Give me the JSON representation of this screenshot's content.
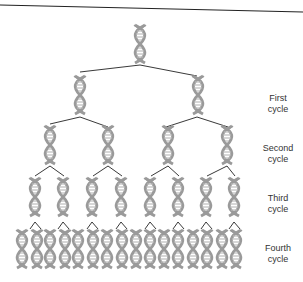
{
  "diagram": {
    "type": "replication-tree",
    "colors": {
      "helix": "#9a9a9a",
      "helix_rungs": "#bdbdbd",
      "branch_line": "#222222",
      "top_rule": "#222222",
      "label_text": "#333333"
    },
    "generations": [
      {
        "index": 0,
        "count": 1,
        "y": 25,
        "x": [
          140
        ]
      },
      {
        "index": 1,
        "count": 2,
        "y": 76,
        "x": [
          80,
          198
        ]
      },
      {
        "index": 2,
        "count": 4,
        "y": 126,
        "x": [
          50,
          108,
          168,
          227
        ]
      },
      {
        "index": 3,
        "count": 8,
        "y": 178,
        "x": [
          35,
          63,
          92,
          121,
          150,
          178,
          206,
          234
        ]
      },
      {
        "index": 4,
        "count": 16,
        "y": 230,
        "x": [
          22,
          37,
          50,
          65,
          78,
          93,
          107,
          122,
          136,
          150,
          164,
          178,
          193,
          207,
          222,
          236
        ]
      }
    ],
    "labels": [
      {
        "line1": "First",
        "line2": "cycle",
        "y": 93
      },
      {
        "line1": "Second",
        "line2": "cycle",
        "y": 143
      },
      {
        "line1": "Third",
        "line2": "cycle",
        "y": 193
      },
      {
        "line1": "Fourth",
        "line2": "cycle",
        "y": 243
      }
    ]
  }
}
